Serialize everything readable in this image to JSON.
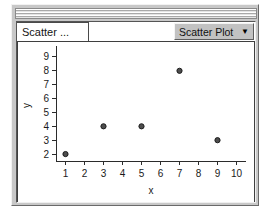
{
  "window": {
    "title_bar_name": "window-title-bar"
  },
  "tabs": [
    {
      "label": "Scatter ...",
      "name": "tab-scatter"
    }
  ],
  "dropdown": {
    "label": "Scatter Plot",
    "caret": "▼"
  },
  "chart_data": {
    "type": "scatter",
    "title": "",
    "xlabel": "x",
    "ylabel": "y",
    "x": [
      1,
      3,
      5,
      7,
      9
    ],
    "values": [
      2,
      4,
      4,
      8,
      3
    ],
    "points": [
      {
        "x": 1,
        "y": 2
      },
      {
        "x": 3,
        "y": 4
      },
      {
        "x": 5,
        "y": 4
      },
      {
        "x": 7,
        "y": 8
      },
      {
        "x": 9,
        "y": 3
      }
    ],
    "xticks": [
      1,
      2,
      3,
      4,
      5,
      6,
      7,
      8,
      9,
      10
    ],
    "yticks": [
      2,
      3,
      4,
      5,
      6,
      7,
      8,
      9
    ],
    "xlim": [
      0.5,
      10.5
    ],
    "ylim": [
      1.5,
      9.5
    ],
    "grid": false,
    "legend": false,
    "marker_color": "#4d4d4d"
  }
}
